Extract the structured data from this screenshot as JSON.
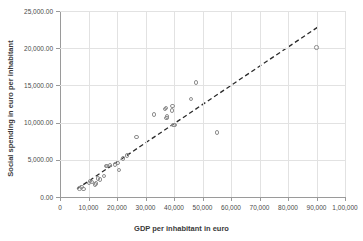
{
  "chart_data": {
    "type": "scatter",
    "title": "",
    "xlabel": "GDP per inhabitant in euro",
    "ylabel": "Social spending in euro per inhabitant",
    "xlim": [
      0,
      100000
    ],
    "ylim": [
      0,
      25000
    ],
    "grid": true,
    "legend": "none",
    "x_tick_labels": [
      "0",
      "10,000",
      "20,000",
      "30,000",
      "40,000",
      "50,000",
      "60,000",
      "70,000",
      "80,000",
      "90,000",
      "1,00,000"
    ],
    "x_tick_values": [
      0,
      10000,
      20000,
      30000,
      40000,
      50000,
      60000,
      70000,
      80000,
      90000,
      100000
    ],
    "y_tick_labels": [
      "0.00",
      "5,000.00",
      "10,000.00",
      "15,000.00",
      "20,000.00",
      "25,000.00"
    ],
    "y_tick_values": [
      0,
      5000,
      10000,
      15000,
      20000,
      25000
    ],
    "marker": {
      "shape": "circle-open",
      "color": "#8e8e8e",
      "size": 4.4
    },
    "points": [
      {
        "x": 6800,
        "y": 1150
      },
      {
        "x": 7600,
        "y": 1350
      },
      {
        "x": 8300,
        "y": 1050
      },
      {
        "x": 10200,
        "y": 1900
      },
      {
        "x": 10600,
        "y": 2150
      },
      {
        "x": 11300,
        "y": 2050
      },
      {
        "x": 12300,
        "y": 1700
      },
      {
        "x": 12600,
        "y": 1800
      },
      {
        "x": 13400,
        "y": 2500
      },
      {
        "x": 14000,
        "y": 2350
      },
      {
        "x": 15400,
        "y": 2800
      },
      {
        "x": 16100,
        "y": 4150
      },
      {
        "x": 16500,
        "y": 4200
      },
      {
        "x": 17500,
        "y": 4300
      },
      {
        "x": 19400,
        "y": 4350
      },
      {
        "x": 20200,
        "y": 4550
      },
      {
        "x": 20800,
        "y": 3600
      },
      {
        "x": 22200,
        "y": 5200
      },
      {
        "x": 23400,
        "y": 5600
      },
      {
        "x": 26900,
        "y": 8050
      },
      {
        "x": 33000,
        "y": 11100
      },
      {
        "x": 36900,
        "y": 11800
      },
      {
        "x": 37200,
        "y": 12000
      },
      {
        "x": 37400,
        "y": 10600
      },
      {
        "x": 37600,
        "y": 10800
      },
      {
        "x": 39200,
        "y": 11650
      },
      {
        "x": 39500,
        "y": 12200
      },
      {
        "x": 39800,
        "y": 9700
      },
      {
        "x": 40200,
        "y": 9650
      },
      {
        "x": 45900,
        "y": 13200
      },
      {
        "x": 47800,
        "y": 15400
      },
      {
        "x": 55000,
        "y": 8650
      },
      {
        "x": 90000,
        "y": 20100
      }
    ],
    "trendline": {
      "style": "dashed",
      "color": "#2a2a2a",
      "x_start": 6000,
      "y_start": 1100,
      "x_end": 90500,
      "y_end": 22850
    }
  }
}
